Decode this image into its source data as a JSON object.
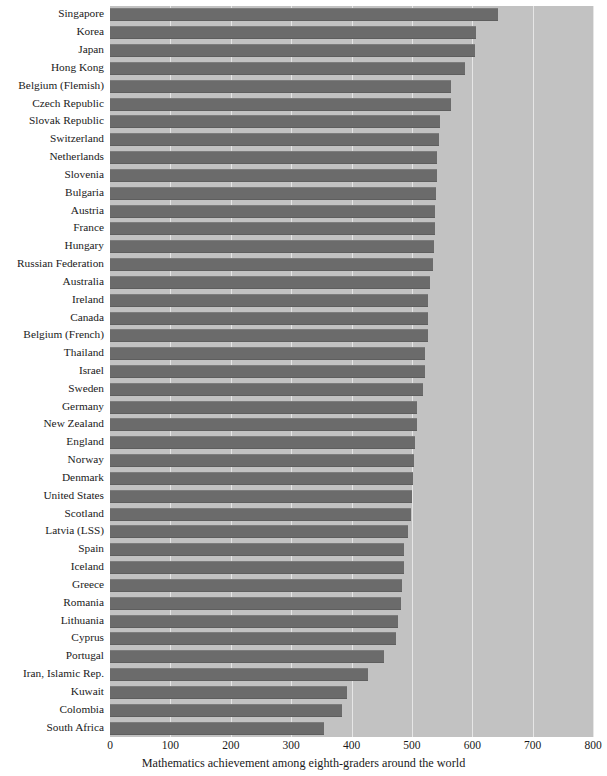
{
  "chart_data": {
    "type": "bar",
    "orientation": "horizontal",
    "title": "",
    "subtitle": "",
    "xlabel": "Mathematics achievement among eighth-graders around the world",
    "ylabel": "",
    "xlim": [
      0,
      800
    ],
    "ylim": null,
    "xticks": [
      0,
      100,
      200,
      300,
      400,
      500,
      600,
      700,
      800
    ],
    "xtick_labels": [
      "0",
      "100",
      "200",
      "300",
      "400",
      "500",
      "600",
      "700",
      "800"
    ],
    "grid": "vertical",
    "legend": null,
    "legend_position": "none",
    "bar_color": "#6b6b6b",
    "plot_background": "#c2c2c2",
    "figure_background": "#ffffff",
    "gridline_color": "#e6e6e6",
    "categories": [
      "Singapore",
      "Korea",
      "Japan",
      "Hong Kong",
      "Belgium (Flemish)",
      "Czech Republic",
      "Slovak Republic",
      "Switzerland",
      "Netherlands",
      "Slovenia",
      "Bulgaria",
      "Austria",
      "France",
      "Hungary",
      "Russian Federation",
      "Australia",
      "Ireland",
      "Canada",
      "Belgium (French)",
      "Thailand",
      "Israel",
      "Sweden",
      "Germany",
      "New Zealand",
      "England",
      "Norway",
      "Denmark",
      "United States",
      "Scotland",
      "Latvia (LSS)",
      "Spain",
      "Iceland",
      "Greece",
      "Romania",
      "Lithuania",
      "Cyprus",
      "Portugal",
      "Iran, Islamic Rep.",
      "Kuwait",
      "Colombia",
      "South Africa"
    ],
    "values": [
      643,
      607,
      605,
      588,
      565,
      564,
      547,
      545,
      541,
      541,
      540,
      539,
      538,
      537,
      535,
      530,
      527,
      527,
      526,
      522,
      522,
      519,
      509,
      508,
      506,
      503,
      502,
      500,
      498,
      493,
      487,
      487,
      484,
      482,
      477,
      474,
      454,
      428,
      392,
      385,
      354
    ]
  }
}
